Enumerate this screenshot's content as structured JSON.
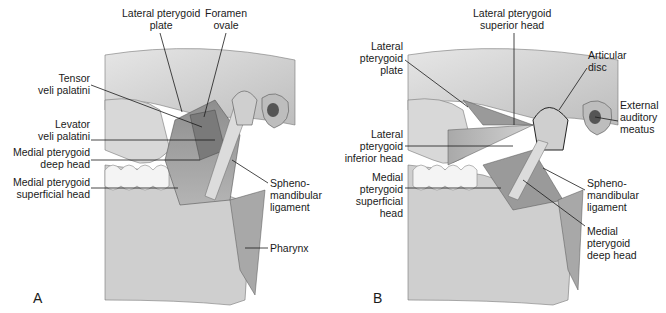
{
  "figure": {
    "panels": [
      {
        "id": "A",
        "letter": "A",
        "labels": {
          "lateral_pterygoid_plate": "Lateral pterygoid\nplate",
          "foramen_ovale": "Foramen\novale",
          "tensor_veli_palatini": "Tensor\nveli palatini",
          "levator_veli_palatini": "Levator\nveli palatini",
          "medial_pterygoid_deep_head": "Medial pterygoid\ndeep head",
          "medial_pterygoid_superficial_head": "Medial pterygoid\nsuperficial head",
          "sphenomandibular_ligament": "Spheno-\nmandibular\nligament",
          "pharynx": "Pharynx"
        }
      },
      {
        "id": "B",
        "letter": "B",
        "labels": {
          "lateral_pterygoid_superior_head": "Lateral pterygoid\nsuperior head",
          "lateral_pterygoid_plate": "Lateral\npterygoid\nplate",
          "articular_disc": "Articular\ndisc",
          "external_auditory_meatus": "External\nauditory\nmeatus",
          "lateral_pterygoid_inferior_head": "Lateral\npterygoid\ninferior head",
          "medial_pterygoid_superficial_head": "Medial\npterygoid\nsuperficial\nhead",
          "sphenomandibular_ligament": "Spheno-\nmandibular\nligament",
          "medial_pterygoid_deep_head": "Medial\npterygoid\ndeep head"
        }
      }
    ]
  }
}
